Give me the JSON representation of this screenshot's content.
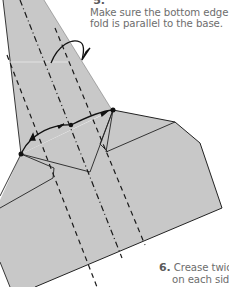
{
  "steps": {
    "step5": {
      "number": "5.",
      "lines": [
        "Fold the corners down so that",
        "Make sure the bottom edge of the",
        "fold is parallel to the base."
      ],
      "visible_lines": [
        "",
        "Make sure the bottom edge o",
        "fold is parallel to the base."
      ]
    },
    "step6": {
      "number": "6.",
      "lines": [
        "Crease twice as i",
        "on each side of t"
      ]
    }
  },
  "diagram": {
    "paper_fill": "#c9c9c9",
    "line_color": "#1a1a1a",
    "elements": [
      "valley-fold-lines",
      "fold-arrow",
      "fold-reference-dots",
      "curved-arrow"
    ]
  }
}
